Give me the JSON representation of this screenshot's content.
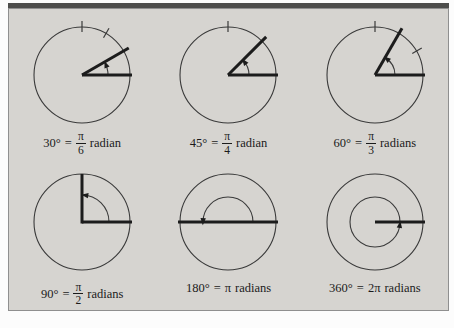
{
  "figure": {
    "background": "#d6d4d0",
    "top_bar_color": "#4d4d4b",
    "frame_border_color": "#8f8f8f",
    "line_color": "#1c1c1c",
    "circle_color": "#3a3a3a",
    "text_color": "#1b1b1b"
  },
  "diagrams": [
    {
      "name": "30-degrees",
      "type": "acute",
      "angle": 30,
      "ticks": [
        60,
        90
      ],
      "arc_radius": 26,
      "label": {
        "deg": "30°",
        "eq": "=",
        "num": "π",
        "den": "6",
        "unit": "radian"
      }
    },
    {
      "name": "45-degrees",
      "type": "acute",
      "angle": 45,
      "ticks": [
        90
      ],
      "arc_radius": 21,
      "label": {
        "deg": "45°",
        "eq": "=",
        "num": "π",
        "den": "4",
        "unit": "radian"
      }
    },
    {
      "name": "60-degrees",
      "type": "acute",
      "angle": 60,
      "ticks": [
        30,
        90
      ],
      "arc_radius": 20,
      "label": {
        "deg": "60°",
        "eq": "=",
        "num": "π",
        "den": "3",
        "unit": "radians"
      }
    },
    {
      "name": "90-degrees",
      "type": "right",
      "angle": 90,
      "ticks": [],
      "arc_radius": 27,
      "label": {
        "deg": "90°",
        "eq": "=",
        "num": "π",
        "den": "2",
        "unit": "radians"
      }
    },
    {
      "name": "180-degrees",
      "type": "straight",
      "angle": 180,
      "ticks": [],
      "arc_radius": 25,
      "label": {
        "deg": "180°",
        "eq": "=",
        "inline": "π",
        "unit": "radians"
      }
    },
    {
      "name": "360-degrees",
      "type": "full",
      "angle": 360,
      "ticks": [],
      "arc_radius": 25,
      "label": {
        "deg": "360°",
        "eq": "=",
        "inline": "2π",
        "unit": "radians"
      }
    }
  ]
}
